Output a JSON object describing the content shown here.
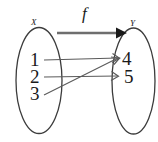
{
  "diagram": {
    "type": "function-mapping-diagram",
    "function_label": "f",
    "domain_set": {
      "name": "X",
      "elements": [
        "1",
        "2",
        "3"
      ]
    },
    "codomain_set": {
      "name": "Y",
      "elements": [
        "4",
        "5"
      ]
    },
    "mappings": [
      {
        "from": "1",
        "to": "4"
      },
      {
        "from": "2",
        "to": "5"
      },
      {
        "from": "3",
        "to": "4"
      }
    ],
    "colors": {
      "background": "#ffffff",
      "ellipse_stroke": "#3c3c3c",
      "mapping_line": "#5a5a5a",
      "function_arrow": "#6e6e6e",
      "arrowhead": "#1a1a1a",
      "text": "#1a1a1a"
    }
  }
}
